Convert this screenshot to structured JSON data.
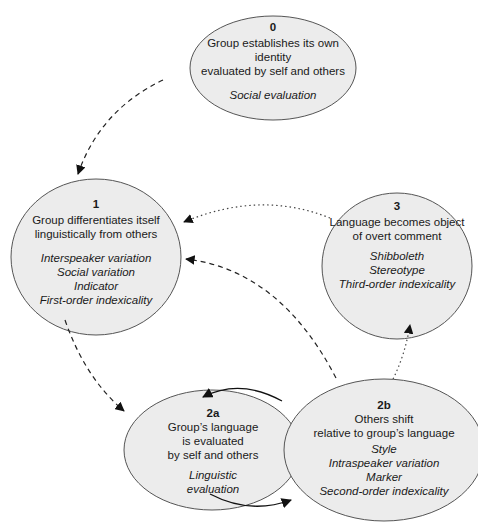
{
  "nodes": {
    "n0": {
      "number": "0",
      "description": [
        "Group establishes its own identity",
        "evaluated by self and others"
      ],
      "terms": [
        "Social evaluation"
      ]
    },
    "n1": {
      "number": "1",
      "description": [
        "Group differentiates itself",
        "linguistically from others"
      ],
      "terms": [
        "Interspeaker variation",
        "Social variation",
        "Indicator",
        "First-order indexicality"
      ]
    },
    "n2a": {
      "number": "2a",
      "description": [
        "Group’s language",
        "is evaluated",
        "by self and others"
      ],
      "terms": [
        "Linguistic",
        "evaluation"
      ]
    },
    "n2b": {
      "number": "2b",
      "description": [
        "Others shift",
        "relative to group’s language"
      ],
      "terms": [
        "Style",
        "Intraspeaker variation",
        "Marker",
        "Second-order indexicality"
      ]
    },
    "n3": {
      "number": "3",
      "description": [
        "Language becomes object",
        "of overt comment"
      ],
      "terms": [
        "Shibboleth",
        "Stereotype",
        "Third-order indexicality"
      ]
    }
  },
  "edges": [
    {
      "from": "0",
      "to": "1",
      "style": "dashed"
    },
    {
      "from": "1",
      "to": "2a",
      "style": "dashed"
    },
    {
      "from": "2a",
      "to": "2b",
      "style": "solid"
    },
    {
      "from": "2b",
      "to": "2a",
      "style": "solid"
    },
    {
      "from": "2b",
      "to": "1",
      "style": "dashed"
    },
    {
      "from": "2b",
      "to": "3",
      "style": "dotted"
    },
    {
      "from": "3",
      "to": "1",
      "style": "dotted"
    }
  ],
  "colors": {
    "ellipse_fill": "#ececec",
    "stroke": "#555555",
    "arrow": "#111111"
  }
}
